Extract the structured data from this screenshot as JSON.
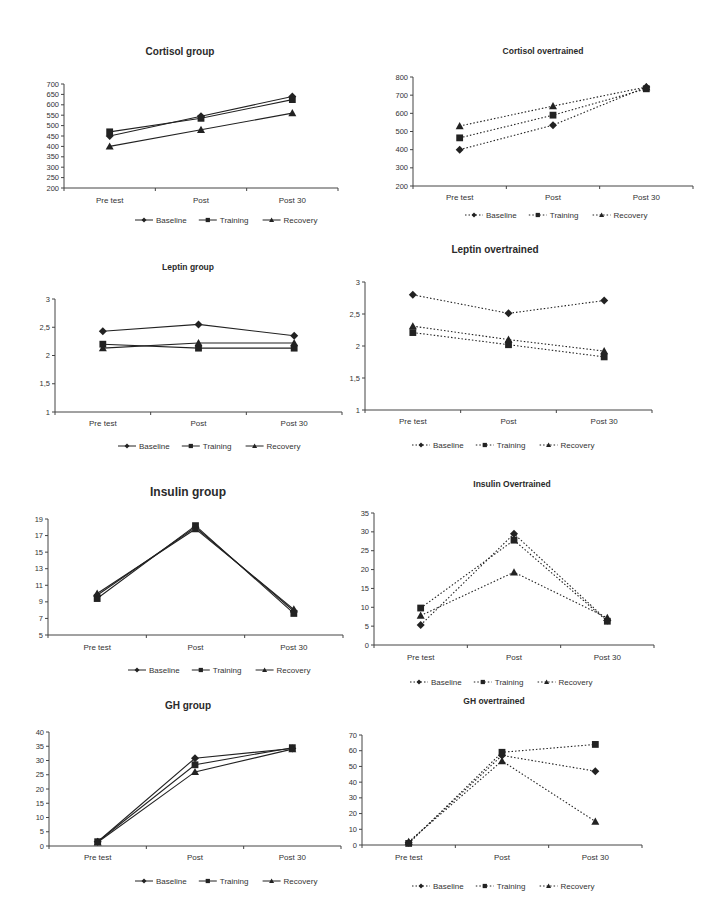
{
  "chart_data": [
    {
      "id": "cortisol-group",
      "type": "line",
      "title": "Cortisol group",
      "line_style": "solid",
      "categories": [
        "Pre test",
        "Post",
        "Post 30"
      ],
      "ylim": [
        200,
        700
      ],
      "yticks": [
        200,
        250,
        300,
        350,
        400,
        450,
        500,
        550,
        600,
        650,
        700
      ],
      "xlabel": "",
      "ylabel": "",
      "legend_position": "bottom",
      "grid": false,
      "series": [
        {
          "name": "Baseline",
          "marker": "diamond",
          "values": [
            450,
            545,
            640
          ]
        },
        {
          "name": "Training",
          "marker": "square",
          "values": [
            470,
            535,
            625
          ]
        },
        {
          "name": "Recovery",
          "marker": "triangle",
          "values": [
            400,
            480,
            560
          ]
        }
      ],
      "layout": {
        "x": 0,
        "y": 40,
        "title_x": 180,
        "title_y": 55,
        "title_size": 10,
        "ax_left": 64,
        "ax_right": 338,
        "ax_top": 84,
        "ax_bottom": 188,
        "cat_y": 203,
        "legend_y": 223,
        "legend_x": 135
      }
    },
    {
      "id": "cortisol-overtrained",
      "type": "line",
      "title": "Cortisol overtrained",
      "line_style": "dotted",
      "categories": [
        "Pre test",
        "Post",
        "Post 30"
      ],
      "ylim": [
        200,
        800
      ],
      "yticks": [
        200,
        300,
        400,
        500,
        600,
        700,
        800
      ],
      "xlabel": "",
      "ylabel": "",
      "legend_position": "bottom",
      "grid": false,
      "series": [
        {
          "name": "Baseline",
          "marker": "diamond",
          "values": [
            400,
            535,
            745
          ]
        },
        {
          "name": "Training",
          "marker": "square",
          "values": [
            465,
            590,
            735
          ]
        },
        {
          "name": "Recovery",
          "marker": "triangle",
          "values": [
            530,
            640,
            745
          ]
        }
      ],
      "layout": {
        "x": 0,
        "y": 0,
        "title_x": 543,
        "title_y": 54,
        "title_size": 8.5,
        "ax_left": 413,
        "ax_right": 693,
        "ax_top": 77,
        "ax_bottom": 186,
        "cat_y": 200,
        "legend_y": 218,
        "legend_x": 465
      }
    },
    {
      "id": "leptin-group",
      "type": "line",
      "title": "Leptin group",
      "line_style": "solid",
      "categories": [
        "Pre test",
        "Post",
        "Post 30"
      ],
      "ylim": [
        1,
        3
      ],
      "yticks": [
        "1",
        "1,5",
        "2",
        "2,5",
        "3"
      ],
      "yticks_values": [
        1,
        1.5,
        2,
        2.5,
        3
      ],
      "xlabel": "",
      "ylabel": "",
      "legend_position": "bottom",
      "grid": false,
      "series": [
        {
          "name": "Baseline",
          "marker": "diamond",
          "values": [
            2.43,
            2.55,
            2.35
          ]
        },
        {
          "name": "Training",
          "marker": "square",
          "values": [
            2.2,
            2.13,
            2.13
          ]
        },
        {
          "name": "Recovery",
          "marker": "triangle",
          "values": [
            2.13,
            2.22,
            2.22
          ]
        }
      ],
      "layout": {
        "x": 0,
        "y": 0,
        "title_x": 188,
        "title_y": 270,
        "title_size": 8.5,
        "ax_left": 55,
        "ax_right": 342,
        "ax_top": 299,
        "ax_bottom": 412,
        "cat_y": 426,
        "legend_y": 449,
        "legend_x": 118
      }
    },
    {
      "id": "leptin-overtrained",
      "type": "line",
      "title": "Leptin overtrained",
      "line_style": "dotted",
      "categories": [
        "Pre test",
        "Post",
        "Post 30"
      ],
      "ylim": [
        1,
        3
      ],
      "yticks": [
        "1",
        "1,5",
        "2",
        "2,5",
        "3"
      ],
      "yticks_values": [
        1,
        1.5,
        2,
        2.5,
        3
      ],
      "xlabel": "",
      "ylabel": "",
      "legend_position": "bottom",
      "grid": false,
      "series": [
        {
          "name": "Baseline",
          "marker": "diamond",
          "values": [
            2.8,
            2.51,
            2.71
          ]
        },
        {
          "name": "Training",
          "marker": "square",
          "values": [
            2.21,
            2.02,
            1.83
          ]
        },
        {
          "name": "Recovery",
          "marker": "triangle",
          "values": [
            2.31,
            2.1,
            1.92
          ]
        }
      ],
      "layout": {
        "x": 0,
        "y": 0,
        "title_x": 495,
        "title_y": 253,
        "title_size": 10,
        "ax_left": 365,
        "ax_right": 652,
        "ax_top": 282,
        "ax_bottom": 410,
        "cat_y": 424,
        "legend_y": 448,
        "legend_x": 412
      }
    },
    {
      "id": "insulin-group",
      "type": "line",
      "title": "Insulin group",
      "line_style": "solid",
      "categories": [
        "Pre test",
        "Post",
        "Post 30"
      ],
      "ylim": [
        5,
        19
      ],
      "yticks": [
        5,
        7,
        9,
        11,
        13,
        15,
        17,
        19
      ],
      "xlabel": "",
      "ylabel": "",
      "legend_position": "bottom",
      "grid": false,
      "series": [
        {
          "name": "Baseline",
          "marker": "diamond",
          "values": [
            9.8,
            18.0,
            7.9
          ]
        },
        {
          "name": "Training",
          "marker": "square",
          "values": [
            9.4,
            18.2,
            7.6
          ]
        },
        {
          "name": "Recovery",
          "marker": "triangle",
          "values": [
            10.0,
            17.8,
            8.1
          ]
        }
      ],
      "layout": {
        "x": 0,
        "y": 0,
        "title_x": 188,
        "title_y": 496,
        "title_size": 12,
        "ax_left": 48,
        "ax_right": 343,
        "ax_top": 519,
        "ax_bottom": 635,
        "cat_y": 650,
        "legend_y": 673,
        "legend_x": 128
      }
    },
    {
      "id": "insulin-overtrained",
      "type": "line",
      "title": "Insulin Overtrained",
      "line_style": "dotted",
      "categories": [
        "Pre test",
        "Post",
        "Post 30"
      ],
      "ylim": [
        0,
        35
      ],
      "yticks": [
        0,
        5,
        10,
        15,
        20,
        25,
        30,
        35
      ],
      "xlabel": "",
      "ylabel": "",
      "legend_position": "bottom",
      "grid": false,
      "series": [
        {
          "name": "Baseline",
          "marker": "diamond",
          "values": [
            5.3,
            29.5,
            6.5
          ]
        },
        {
          "name": "Training",
          "marker": "square",
          "values": [
            9.8,
            27.8,
            6.3
          ]
        },
        {
          "name": "Recovery",
          "marker": "triangle",
          "values": [
            7.8,
            19.3,
            7.2
          ]
        }
      ],
      "layout": {
        "x": 0,
        "y": 0,
        "title_x": 512,
        "title_y": 487,
        "title_size": 8.5,
        "ax_left": 374,
        "ax_right": 654,
        "ax_top": 513,
        "ax_bottom": 645,
        "cat_y": 660,
        "legend_y": 685,
        "legend_x": 410
      }
    },
    {
      "id": "gh-group",
      "type": "line",
      "title": "GH group",
      "line_style": "solid",
      "categories": [
        "Pre test",
        "Post",
        "Post 30"
      ],
      "ylim": [
        0,
        40
      ],
      "yticks": [
        0,
        5,
        10,
        15,
        20,
        25,
        30,
        35,
        40
      ],
      "xlabel": "",
      "ylabel": "",
      "legend_position": "bottom",
      "grid": false,
      "series": [
        {
          "name": "Baseline",
          "marker": "diamond",
          "values": [
            1.5,
            30.8,
            34.2
          ]
        },
        {
          "name": "Training",
          "marker": "square",
          "values": [
            1.5,
            28.5,
            34.5
          ]
        },
        {
          "name": "Recovery",
          "marker": "triangle",
          "values": [
            1.3,
            26.0,
            34.0
          ]
        }
      ],
      "layout": {
        "x": 0,
        "y": 0,
        "title_x": 188,
        "title_y": 709,
        "title_size": 10,
        "ax_left": 49,
        "ax_right": 341,
        "ax_top": 732,
        "ax_bottom": 846,
        "cat_y": 860,
        "legend_y": 884,
        "legend_x": 135
      }
    },
    {
      "id": "gh-overtrained",
      "type": "line",
      "title": "GH overtrained",
      "line_style": "dotted",
      "categories": [
        "Pre test",
        "Post",
        "Post 30"
      ],
      "ylim": [
        0,
        70
      ],
      "yticks": [
        0,
        10,
        20,
        30,
        40,
        50,
        60,
        70
      ],
      "xlabel": "",
      "ylabel": "",
      "legend_position": "bottom",
      "grid": false,
      "series": [
        {
          "name": "Baseline",
          "marker": "diamond",
          "values": [
            1.5,
            57,
            47
          ]
        },
        {
          "name": "Training",
          "marker": "square",
          "values": [
            1.0,
            59,
            64
          ]
        },
        {
          "name": "Recovery",
          "marker": "triangle",
          "values": [
            2.0,
            53.5,
            15
          ]
        }
      ],
      "layout": {
        "x": 0,
        "y": 0,
        "title_x": 494,
        "title_y": 704,
        "title_size": 8.5,
        "ax_left": 362,
        "ax_right": 642,
        "ax_top": 735,
        "ax_bottom": 845,
        "cat_y": 860,
        "legend_y": 889,
        "legend_x": 412
      }
    }
  ]
}
